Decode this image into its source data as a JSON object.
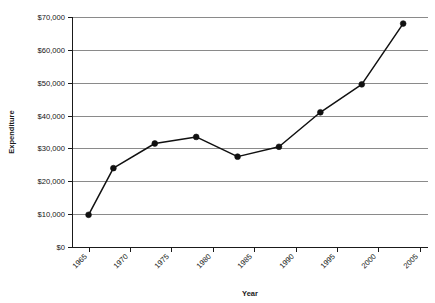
{
  "chart_data": {
    "type": "line",
    "title": "",
    "subtitle": "",
    "xlabel": "Year",
    "ylabel": "Expenditure",
    "x": [
      1965,
      1968,
      1973,
      1978,
      1983,
      1988,
      1993,
      1998,
      2003
    ],
    "values": [
      9800,
      24000,
      31500,
      33500,
      27500,
      30500,
      41000,
      49500,
      68000
    ],
    "series": [
      {
        "name": "Expenditure",
        "values": [
          9800,
          24000,
          31500,
          33500,
          27500,
          30500,
          41000,
          49500,
          68000
        ]
      }
    ],
    "xlim": [
      1963,
      2006
    ],
    "ylim": [
      0,
      70000
    ],
    "xticks": [
      1965,
      1970,
      1975,
      1980,
      1985,
      1990,
      1995,
      2000,
      2005
    ],
    "xtick_labels": [
      "1965",
      "1970",
      "1975",
      "1980",
      "1985",
      "1990",
      "1995",
      "2000",
      "2005"
    ],
    "yticks": [
      0,
      10000,
      20000,
      30000,
      40000,
      50000,
      60000,
      70000
    ],
    "ytick_labels": [
      "$0",
      "$10,000",
      "$20,000",
      "$30,000",
      "$40,000",
      "$50,000",
      "$60,000",
      "$70,000"
    ],
    "grid": true,
    "grid_axis": "y",
    "legend": false,
    "legend_position": "none",
    "marker": "circle",
    "line_color": "#111111",
    "marker_color": "#111111",
    "grid_color": "#8a8a8a",
    "background_color": "#ffffff"
  }
}
